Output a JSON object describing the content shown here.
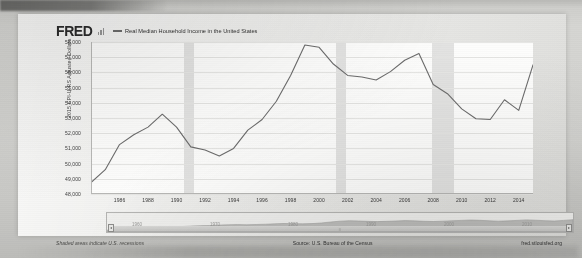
{
  "header": {
    "logo_text": "FRED",
    "logo_icon": "bar-chart-icon",
    "legend_label": "Real Median Household Income in the United States"
  },
  "footer": {
    "note": "Shaded areas indicate U.S. recessions",
    "source": "Source: U.S. Bureau of the Census",
    "url": "fred.stlouisfed.org"
  },
  "navigator": {
    "handle_left_glyph": "◂",
    "handle_right_glyph": "▸",
    "center_label": "≡",
    "year_labels": [
      "1960",
      "1970",
      "1980",
      "1990",
      "2000",
      "2010"
    ]
  },
  "colors": {
    "line": "#6c6c6c",
    "plot_background": "#fdfdfc",
    "recession_band": "#e2e2e0",
    "gridline": "#e6e6e4",
    "paper": "#eeeeec",
    "page": "#c9c9c7",
    "text": "#2f2f2f"
  },
  "chart_data": {
    "type": "line",
    "title": "Real Median Household Income in the United States",
    "xlabel": "",
    "ylabel": "2015 CPI-U-RS Adjusted Dollars",
    "ylim": [
      48000,
      58000
    ],
    "xlim": [
      1984,
      2015
    ],
    "ytick_labels": [
      "58,000",
      "57,000",
      "56,000",
      "55,000",
      "54,000",
      "53,000",
      "52,000",
      "51,000",
      "50,000",
      "49,000",
      "48,000"
    ],
    "ytick_values": [
      58000,
      57000,
      56000,
      55000,
      54000,
      53000,
      52000,
      51000,
      50000,
      49000,
      48000
    ],
    "xtick_labels": [
      "1986",
      "1988",
      "1990",
      "1992",
      "1994",
      "1996",
      "1998",
      "2000",
      "2002",
      "2004",
      "2006",
      "2008",
      "2010",
      "2012",
      "2014"
    ],
    "xtick_values": [
      1986,
      1988,
      1990,
      1992,
      1994,
      1996,
      1998,
      2000,
      2002,
      2004,
      2006,
      2008,
      2010,
      2012,
      2014
    ],
    "grid": true,
    "legend_position": "top",
    "series": [
      {
        "name": "Real Median Household Income in the United States",
        "color": "#6c6c6c",
        "x": [
          1984,
          1985,
          1986,
          1987,
          1988,
          1989,
          1990,
          1991,
          1992,
          1993,
          1994,
          1995,
          1996,
          1997,
          1998,
          1999,
          2000,
          2001,
          2002,
          2003,
          2004,
          2005,
          2006,
          2007,
          2008,
          2009,
          2010,
          2011,
          2012,
          2013,
          2014,
          2015
        ],
        "values": [
          48750,
          49600,
          51250,
          51900,
          52400,
          53250,
          52400,
          51100,
          50900,
          50500,
          51000,
          52200,
          52900,
          54100,
          55800,
          57800,
          57650,
          56550,
          55800,
          55700,
          55500,
          56050,
          56800,
          57250,
          55200,
          54600,
          53600,
          52950,
          52900,
          54200,
          53500,
          56500
        ]
      }
    ],
    "recession_bands": [
      {
        "start": 1990.5,
        "end": 1991.2
      },
      {
        "start": 2001.2,
        "end": 2001.9
      },
      {
        "start": 2007.95,
        "end": 2009.45
      }
    ],
    "annotations": [
      "Shaded areas indicate U.S. recessions",
      "Source: U.S. Bureau of the Census",
      "fred.stlouisfed.org"
    ]
  }
}
